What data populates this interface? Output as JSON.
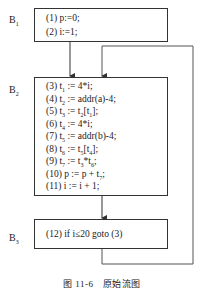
{
  "blocks": [
    {
      "label": "B",
      "sub": "1",
      "statements": [
        {
          "pre": "(1) p:=0;"
        },
        {
          "pre": "(2) i:=1;"
        }
      ]
    },
    {
      "label": "B",
      "sub": "2",
      "statements": [
        {
          "pre": "(3) t",
          "s1": "1",
          "post": " := 4*i;"
        },
        {
          "pre": "(4) t",
          "s1": "2",
          "post": " := addr(a)-4;"
        },
        {
          "pre": "(5) t",
          "s1": "3",
          "mid": " := t",
          "s2": "2",
          "mid2": "[t",
          "s3": "1",
          "post": "];"
        },
        {
          "pre": "(6) t",
          "s1": "4",
          "post": " := 4*i;"
        },
        {
          "pre": "(7) t",
          "s1": "5",
          "post": " := addr(b)-4;"
        },
        {
          "pre": "(8) t",
          "s1": "6",
          "mid": " := t",
          "s2": "5",
          "mid2": "[t",
          "s3": "4",
          "post": "];"
        },
        {
          "pre": "(9) t",
          "s1": "7",
          "mid": " := t",
          "s2": "3",
          "mid2": "*t",
          "s3": "6",
          "post": ";"
        },
        {
          "pre": "(10) p := p + t",
          "s1": "7",
          "post": ";"
        },
        {
          "pre": "(11) i := i + 1;"
        }
      ]
    },
    {
      "label": "B",
      "sub": "3",
      "statements": [
        {
          "pre": "(12) if i≤20 goto (3)"
        }
      ]
    }
  ],
  "caption": "图 11-6　原始流图"
}
